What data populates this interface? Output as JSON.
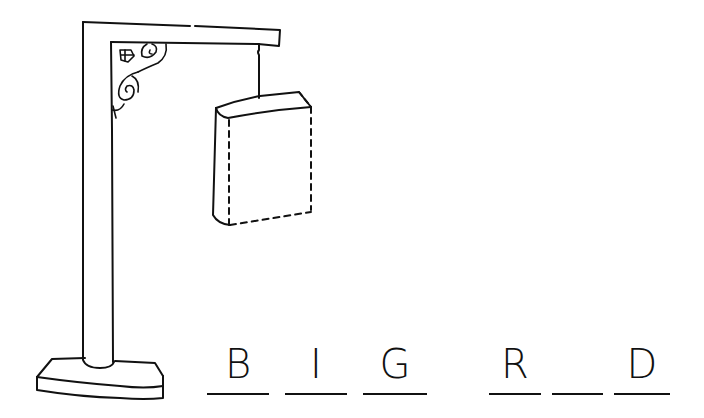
{
  "game": {
    "title": "Hangman",
    "drawing_elements": [
      "gallows-base",
      "gallows-post",
      "gallows-beam",
      "ornamental-bracket",
      "hanging-sign"
    ],
    "word_slots": [
      {
        "letter": "B",
        "revealed": true
      },
      {
        "letter": "I",
        "revealed": true
      },
      {
        "letter": "G",
        "revealed": true
      },
      {
        "letter": "",
        "revealed": false,
        "is_space": true
      },
      {
        "letter": "R",
        "revealed": true
      },
      {
        "letter": "",
        "revealed": false
      },
      {
        "letter": "D",
        "revealed": true
      }
    ],
    "slots": {
      "s1": "B",
      "s2": "I",
      "s3": "G",
      "s4": "R",
      "s5": "",
      "s6": "D"
    }
  },
  "colors": {
    "ink": "#111111",
    "paper": "#ffffff"
  }
}
